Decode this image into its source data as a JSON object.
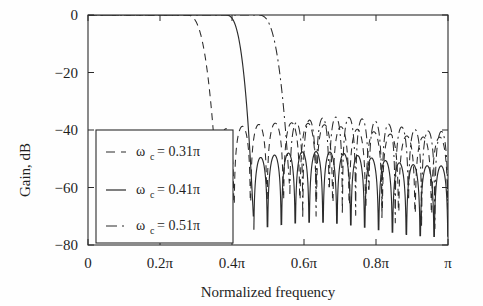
{
  "chart_data": {
    "type": "line",
    "title": "",
    "xlabel": "Normalized frequency",
    "ylabel": "Gain, dB",
    "xlim": [
      0,
      1
    ],
    "ylim": [
      -80,
      0
    ],
    "grid": false,
    "legend_position": "lower left",
    "xticks": [
      0,
      0.2,
      0.4,
      0.6,
      0.8,
      1
    ],
    "xticklabels": [
      "0",
      "0.2π",
      "0.4π",
      "0.6π",
      "0.8π",
      "π"
    ],
    "yticks": [
      0,
      -20,
      -40,
      -60,
      -80
    ],
    "yticklabels": [
      "0",
      "−20",
      "−40",
      "−60",
      "−80"
    ],
    "series": [
      {
        "name": "ω c= 0.31π",
        "omega_symbol": "ω",
        "subscript": "c",
        "equals_value": "= 0.31π",
        "cutoff": 0.31,
        "linestyle": "dashed",
        "color": "#2b2b2b",
        "passband_db": 0,
        "transition_start": 0.27,
        "transition_end": 0.36,
        "stopband_level_db": -40,
        "ripple_count": 14
      },
      {
        "name": "ω c= 0.41π",
        "omega_symbol": "ω",
        "subscript": "c",
        "equals_value": "= 0.41π",
        "cutoff": 0.41,
        "linestyle": "solid",
        "color": "#2b2b2b",
        "passband_db": 0,
        "transition_start": 0.38,
        "transition_end": 0.46,
        "stopband_level_db": -50,
        "ripple_count": 14
      },
      {
        "name": "ω c= 0.51π",
        "omega_symbol": "ω",
        "subscript": "c",
        "equals_value": "= 0.51π",
        "cutoff": 0.51,
        "linestyle": "dashdot",
        "color": "#2b2b2b",
        "passband_db": 0,
        "transition_start": 0.47,
        "transition_end": 0.56,
        "stopband_level_db": -38,
        "ripple_count": 12
      }
    ]
  },
  "colors": {
    "background": "#fefefe",
    "axis": "#2b2b2b",
    "text": "#1f1f1f",
    "legend_border": "#2b2b2b"
  }
}
